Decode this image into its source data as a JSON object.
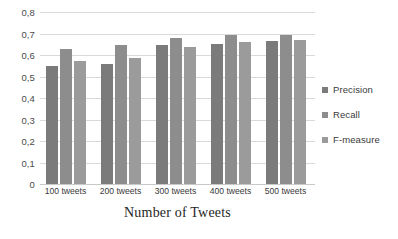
{
  "chart_data": {
    "type": "bar",
    "title": "",
    "subtitle": "",
    "xlabel": "Number of Tweets",
    "ylabel": "",
    "categories": [
      "100 tweets",
      "200 tweets",
      "300 tweets",
      "400 tweets",
      "500 tweets"
    ],
    "series": [
      {
        "name": "Precision",
        "values": [
          0.55,
          0.557,
          0.645,
          0.653,
          0.667
        ],
        "color": "#7b7b7b"
      },
      {
        "name": "Recall",
        "values": [
          0.629,
          0.648,
          0.678,
          0.694,
          0.695
        ],
        "color": "#8d8d8d"
      },
      {
        "name": "F-measure",
        "values": [
          0.572,
          0.587,
          0.637,
          0.661,
          0.672
        ],
        "color": "#9b9b9b"
      }
    ],
    "ylim": [
      0,
      0.8
    ],
    "ytick_labels": [
      "0,8",
      "0,7",
      "0,6",
      "0,5",
      "0,4",
      "0,3",
      "0,2",
      "0,1",
      "0"
    ],
    "ytick_values": [
      0.8,
      0.7,
      0.6,
      0.5,
      0.4,
      0.3,
      0.2,
      0.1,
      0
    ],
    "decimal_separator": ",",
    "grid": true,
    "grid_axis": "y",
    "grid_color": "#d9d9d9",
    "legend_position": "right",
    "background_color": "#ffffff",
    "axis_text_color": "#3a3a3a"
  }
}
